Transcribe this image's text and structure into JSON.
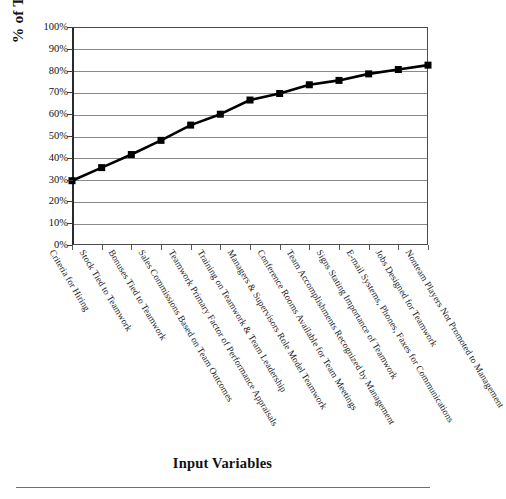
{
  "chart_data": {
    "type": "line",
    "title": "",
    "xlabel": "Input Variables",
    "ylabel": "% of Time Teamwork Is Practiced",
    "ylim": [
      0,
      100
    ],
    "ytick_labels": [
      "100%",
      "90%",
      "80%",
      "70%",
      "60%",
      "50%",
      "40%",
      "30%",
      "20%",
      "10%",
      "0%"
    ],
    "ytick_values": [
      100,
      90,
      80,
      70,
      60,
      50,
      40,
      30,
      20,
      10,
      0
    ],
    "grid": "horizontal",
    "legend": "none",
    "marker": "square",
    "line_color": "#000000",
    "marker_color": "#000000",
    "categories": [
      "Criteria for Hiring",
      "Stock Tied to Teamwork",
      "Bonuses Tied to Teamwork",
      "Sales Commissions Based on Team Outcomes",
      "Teamwork Primary Factor of Performance Appraisals",
      "Training on Teamwork & Team Leadership",
      "Managers & Supervisors Role Model Teamwork",
      "Conference Rooms Available for Team Meetings",
      "Team Accomplishments Recognized by Management",
      "Signs Stating Importance of Teamwork",
      "E-mail Systems, Phones, Faxes for Communications",
      "Jobs Designed for Teamwork",
      "Nonteam Players Not Promoted to Management"
    ],
    "values": [
      29.5,
      35.5,
      41.5,
      48,
      55,
      60,
      66.5,
      69.5,
      73.5,
      75.5,
      78.5,
      80.5,
      82.5
    ]
  }
}
